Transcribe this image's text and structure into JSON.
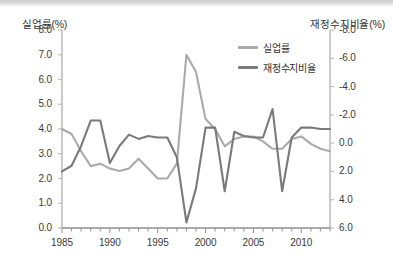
{
  "chart_data": {
    "type": "line",
    "title": "",
    "xlabel": "",
    "x": [
      1985,
      1986,
      1987,
      1988,
      1989,
      1990,
      1991,
      1992,
      1993,
      1994,
      1995,
      1996,
      1997,
      1998,
      1999,
      2000,
      2001,
      2002,
      2003,
      2004,
      2005,
      2006,
      2007,
      2008,
      2009,
      2010,
      2011,
      2012,
      2013
    ],
    "x_tick_labels": [
      "1985",
      "1990",
      "1995",
      "2000",
      "2005",
      "2010"
    ],
    "x_tick_values": [
      1985,
      1990,
      1995,
      2000,
      2005,
      2010
    ],
    "xlim": [
      1985,
      2013
    ],
    "grid": false,
    "legend_position": "top-right",
    "axes": [
      {
        "id": "left",
        "name": "실업률(%)",
        "ylabel": "실업률(%)",
        "ylim": [
          0.0,
          8.0
        ],
        "inverted": false,
        "tick_labels": [
          "8.0",
          "7.0",
          "6.0",
          "5.0",
          "4.0",
          "3.0",
          "2.0",
          "1.0",
          "0.0"
        ],
        "tick_values": [
          8.0,
          7.0,
          6.0,
          5.0,
          4.0,
          3.0,
          2.0,
          1.0,
          0.0
        ]
      },
      {
        "id": "right",
        "name": "재정수지비율(%)",
        "ylabel": "재정수지비율(%)",
        "ylim": [
          -8.0,
          6.0
        ],
        "inverted": true,
        "tick_labels": [
          "-8.0",
          "-6.0",
          "-4.0",
          "-2.0",
          "0.0",
          "2.0",
          "4.0",
          "6.0"
        ],
        "tick_values": [
          -8.0,
          -6.0,
          -4.0,
          -2.0,
          0.0,
          2.0,
          4.0,
          6.0
        ]
      }
    ],
    "series": [
      {
        "name": "실업률",
        "axis": "left",
        "color": "#aaaaaa",
        "values": [
          4.0,
          3.8,
          3.1,
          2.5,
          2.6,
          2.4,
          2.3,
          2.4,
          2.8,
          2.4,
          2.0,
          2.0,
          2.6,
          7.0,
          6.3,
          4.4,
          4.0,
          3.3,
          3.6,
          3.7,
          3.7,
          3.5,
          3.2,
          3.2,
          3.6,
          3.7,
          3.4,
          3.2,
          3.1
        ]
      },
      {
        "name": "재정수지비율",
        "axis": "right",
        "color": "#7a7a7a",
        "values": [
          2.0,
          1.6,
          0.2,
          -1.6,
          -1.6,
          1.4,
          0.2,
          -0.6,
          -0.3,
          -0.5,
          -0.4,
          -0.4,
          1.0,
          5.6,
          3.2,
          -1.1,
          -1.1,
          3.4,
          -0.8,
          -0.5,
          -0.4,
          -0.4,
          -2.4,
          3.4,
          -0.4,
          -1.1,
          -1.1,
          -1.0,
          -1.0
        ]
      }
    ]
  },
  "legend": {
    "items": [
      {
        "label": "실업률",
        "color": "#aaaaaa"
      },
      {
        "label": "재정수지비율",
        "color": "#7a7a7a"
      }
    ]
  },
  "axis_titles": {
    "left": "실업률(%)",
    "right": "재정수지비율(%)"
  }
}
